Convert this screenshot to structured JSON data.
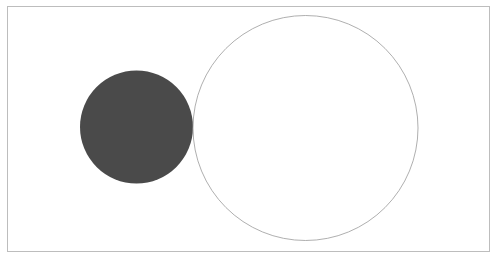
{
  "diagram": {
    "frame": {
      "x": 7.5,
      "y": 6.5,
      "width": 482,
      "height": 245,
      "stroke": "#bdbdbd"
    },
    "shapes": [
      {
        "name": "filled-circle",
        "cx": 136.5,
        "cy": 127,
        "r": 56.5,
        "fill": "#4a4a4a",
        "stroke": "none"
      },
      {
        "name": "outline-circle",
        "cx": 305.5,
        "cy": 128,
        "r": 112.5,
        "fill": "none",
        "stroke": "#9a9a9a"
      }
    ]
  }
}
